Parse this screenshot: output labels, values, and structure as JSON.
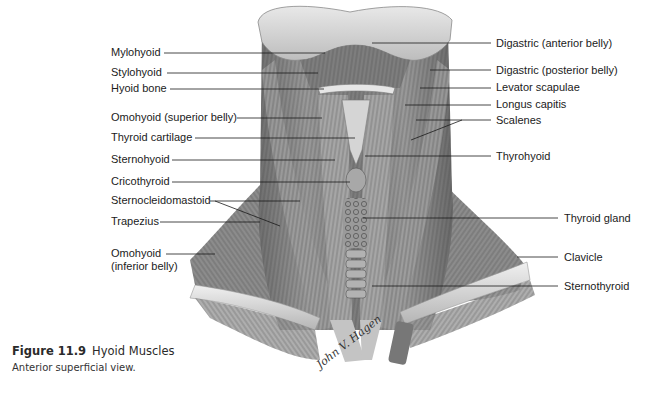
{
  "figure": {
    "number": "Figure 11.9",
    "title": "Hyoid Muscles",
    "subtitle": "Anterior superficial view.",
    "signature": "John V. Hagen"
  },
  "labels_left": [
    {
      "id": "mylohyoid",
      "text": "Mylohyoid"
    },
    {
      "id": "stylohyoid",
      "text": "Stylohyoid"
    },
    {
      "id": "hyoid-bone",
      "text": "Hyoid bone"
    },
    {
      "id": "omohyoid-superior",
      "text": "Omohyoid (superior belly)"
    },
    {
      "id": "thyroid-cartilage",
      "text": "Thyroid cartilage"
    },
    {
      "id": "sternohyoid",
      "text": "Sternohyoid"
    },
    {
      "id": "cricothyroid",
      "text": "Cricothyroid"
    },
    {
      "id": "sternocleidomastoid",
      "text": "Sternocleidomastoid"
    },
    {
      "id": "trapezius",
      "text": "Trapezius"
    },
    {
      "id": "omohyoid-inferior-1",
      "text": "Omohyoid"
    },
    {
      "id": "omohyoid-inferior-2",
      "text": "(inferior belly)"
    }
  ],
  "labels_right": [
    {
      "id": "digastric-anterior",
      "text": "Digastric (anterior belly)"
    },
    {
      "id": "digastric-posterior",
      "text": "Digastric (posterior belly)"
    },
    {
      "id": "levator-scapulae",
      "text": "Levator scapulae"
    },
    {
      "id": "longus-capitis",
      "text": "Longus capitis"
    },
    {
      "id": "scalenes",
      "text": "Scalenes"
    },
    {
      "id": "thyrohyoid",
      "text": "Thyrohyoid"
    },
    {
      "id": "thyroid-gland",
      "text": "Thyroid gland"
    },
    {
      "id": "clavicle",
      "text": "Clavicle"
    },
    {
      "id": "sternothyroid",
      "text": "Sternothyroid"
    }
  ],
  "colors": {
    "muscle_dark": "#5a5a5a",
    "muscle_mid": "#8a8a8a",
    "bone_light": "#d8d8d8",
    "leader_line": "#1a1a1a"
  }
}
